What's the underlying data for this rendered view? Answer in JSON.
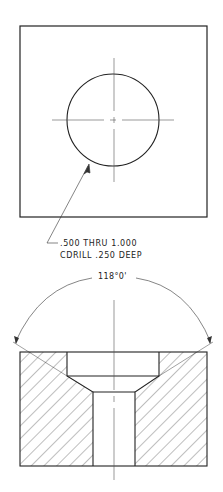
{
  "drawing": {
    "title": "Countersunk / counterdrilled hole — top view and section",
    "top_view": {
      "note_line1": ".500 THRU 1.000",
      "note_line2": "CDRILL .250 DEEP"
    },
    "section_view": {
      "angle_label": "118°0'"
    },
    "colors": {
      "line": "#222222",
      "hatch": "#444444",
      "centerline": "#555555",
      "background": "#ffffff"
    }
  }
}
